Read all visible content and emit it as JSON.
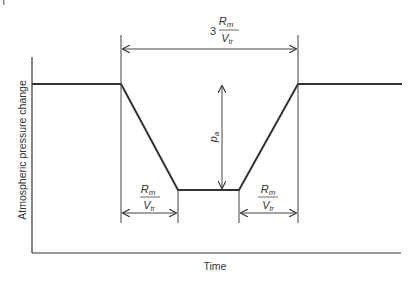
{
  "diagram": {
    "type": "trapezoidal pressure pulse",
    "x_axis_label": "Time",
    "y_axis_label": "Atmospheric pressure change",
    "top_dimension": {
      "coefficient": "3",
      "numerator": "R",
      "numerator_sub": "m",
      "denominator": "V",
      "denominator_sub": "tr"
    },
    "left_dimension": {
      "numerator": "R",
      "numerator_sub": "m",
      "denominator": "V",
      "denominator_sub": "tr"
    },
    "right_dimension": {
      "numerator": "R",
      "numerator_sub": "m",
      "denominator": "V",
      "denominator_sub": "tr"
    },
    "amplitude_label": {
      "symbol": "p",
      "sub": "a"
    },
    "colors": {
      "line": "#333333",
      "text": "#333333",
      "background": "#ffffff"
    }
  }
}
